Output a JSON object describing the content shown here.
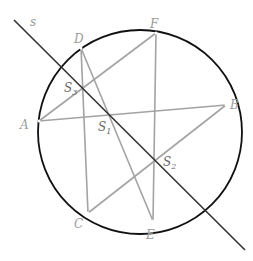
{
  "diagram": {
    "circle": {
      "cx": 140,
      "cy": 132,
      "r": 102,
      "color": "#111111"
    },
    "line_s": {
      "label": "s",
      "x1": 14,
      "y1": 20,
      "x2": 245,
      "y2": 250,
      "color": "#333333"
    },
    "points": {
      "A": {
        "label": "A",
        "x": 39,
        "y": 121
      },
      "B": {
        "label": "B",
        "x": 226,
        "y": 105
      },
      "C": {
        "label": "C",
        "x": 88,
        "y": 213
      },
      "D": {
        "label": "D",
        "x": 81,
        "y": 48
      },
      "E": {
        "label": "E",
        "x": 153,
        "y": 221
      },
      "F": {
        "label": "F",
        "x": 156,
        "y": 33
      },
      "S1": {
        "label": "S",
        "sub": "1",
        "x": 110,
        "y": 117
      },
      "S2": {
        "label": "S",
        "sub": "2",
        "x": 154,
        "y": 160
      },
      "S3": {
        "label": "S",
        "sub": "3",
        "x": 82,
        "y": 87
      }
    },
    "segments": [
      [
        "A",
        "B"
      ],
      [
        "A",
        "F"
      ],
      [
        "B",
        "C"
      ],
      [
        "D",
        "C"
      ],
      [
        "D",
        "E"
      ],
      [
        "F",
        "E"
      ]
    ],
    "segment_color": "#a0a0a0"
  }
}
